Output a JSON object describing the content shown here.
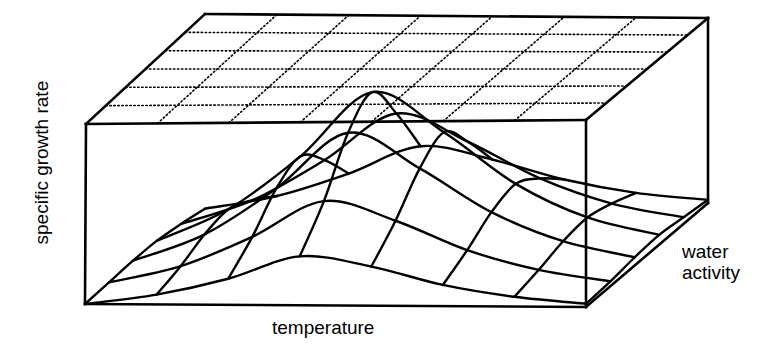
{
  "figure": {
    "title": "",
    "background_color": "#ffffff",
    "line_color": "#000000",
    "width": 784,
    "height": 357
  },
  "labels": {
    "y_axis": "specific growth rate",
    "x_axis": "temperature",
    "z_axis_line1": "water",
    "z_axis_line2": "activity"
  },
  "chart_data": {
    "type": "surface-3d",
    "title": "",
    "xlabel": "temperature",
    "ylabel": "specific growth rate",
    "zlabel": "water activity",
    "grid": true,
    "legend": false,
    "axis_ticks": false,
    "x_categories": [
      "t0",
      "t1",
      "t2",
      "t3",
      "t4",
      "t5",
      "t6",
      "t7"
    ],
    "z_categories": [
      "a0",
      "a1",
      "a2",
      "a3",
      "a4",
      "a5"
    ],
    "values": [
      [
        0.0,
        0.06,
        0.16,
        0.3,
        0.24,
        0.13,
        0.06,
        0.02
      ],
      [
        0.02,
        0.12,
        0.3,
        0.52,
        0.4,
        0.22,
        0.1,
        0.03
      ],
      [
        0.04,
        0.2,
        0.48,
        0.82,
        0.6,
        0.33,
        0.15,
        0.05
      ],
      [
        0.05,
        0.24,
        0.56,
        0.95,
        0.7,
        0.38,
        0.17,
        0.06
      ],
      [
        0.04,
        0.18,
        0.42,
        0.7,
        0.52,
        0.29,
        0.13,
        0.04
      ],
      [
        0.02,
        0.09,
        0.22,
        0.38,
        0.29,
        0.16,
        0.07,
        0.02
      ]
    ],
    "ylim": [
      0,
      1
    ]
  },
  "geometry": {
    "box": {
      "front_left_top": [
        86,
        124
      ],
      "front_right_top": [
        586,
        120
      ],
      "back_left_top": [
        205,
        14
      ],
      "back_right_top": [
        708,
        18
      ],
      "front_left_bottom": [
        85,
        304
      ],
      "front_right_bottom": [
        586,
        307
      ],
      "back_right_bottom": [
        708,
        203
      ]
    },
    "ceiling_grid": {
      "cols": 7,
      "rows": 6,
      "style": "dotted"
    },
    "surface_grid": {
      "cols": 8,
      "rows": 6,
      "style": "solid"
    }
  }
}
